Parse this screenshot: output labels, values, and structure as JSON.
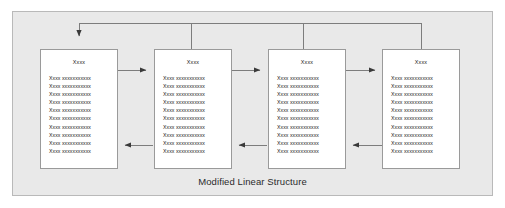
{
  "diagram": {
    "caption": "Modified Linear Structure",
    "panel": {
      "background_color": "#e9e9e9",
      "border_color": "#b9b9b9"
    },
    "line_color": "#7d7d7d",
    "node_border_color": "#9a9a9a",
    "node_fill_color": "#ffffff",
    "text_color": "#1a1a1a",
    "nodes": [
      {
        "id": "node-1",
        "title": "Xxxx",
        "lines": [
          "Xxxx xxxxxxxxxxx",
          "Xxxx xxxxxxxxxxx",
          "Xxxx xxxxxxxxxxx",
          "Xxxx xxxxxxxxxxx",
          "Xxxx xxxxxxxxxxx",
          "Xxxx xxxxxxxxxxx",
          "Xxxx xxxxxxxxxxx",
          "Xxxx xxxxxxxxxxx",
          "Xxxx xxxxxxxxxxx",
          "Xxxx xxxxxxxxxxx"
        ]
      },
      {
        "id": "node-2",
        "title": "Xxxx",
        "lines": [
          "Xxxx xxxxxxxxxxx",
          "Xxxx xxxxxxxxxxx",
          "Xxxx xxxxxxxxxxx",
          "Xxxx xxxxxxxxxxx",
          "Xxxx xxxxxxxxxxx",
          "Xxxx xxxxxxxxxxx",
          "Xxxx xxxxxxxxxxx",
          "Xxxx xxxxxxxxxxx",
          "Xxxx xxxxxxxxxxx",
          "Xxxx xxxxxxxxxxx"
        ]
      },
      {
        "id": "node-3",
        "title": "Xxxx",
        "lines": [
          "Xxxx xxxxxxxxxxx",
          "Xxxx xxxxxxxxxxx",
          "Xxxx xxxxxxxxxxx",
          "Xxxx xxxxxxxxxxx",
          "Xxxx xxxxxxxxxxx",
          "Xxxx xxxxxxxxxxx",
          "Xxxx xxxxxxxxxxx",
          "Xxxx xxxxxxxxxxx",
          "Xxxx xxxxxxxxxxx",
          "Xxxx xxxxxxxxxxx"
        ]
      },
      {
        "id": "node-4",
        "title": "Xxxx",
        "lines": [
          "Xxxx xxxxxxxxxxx",
          "Xxxx xxxxxxxxxxx",
          "Xxxx xxxxxxxxxxx",
          "Xxxx xxxxxxxxxxx",
          "Xxxx xxxxxxxxxxx",
          "Xxxx xxxxxxxxxxx",
          "Xxxx xxxxxxxxxxx",
          "Xxxx xxxxxxxxxxx",
          "Xxxx xxxxxxxxxxx",
          "Xxxx xxxxxxxxxxx"
        ]
      }
    ],
    "connectors": {
      "forward_arrows": [
        "node-1-to-node-2",
        "node-2-to-node-3",
        "node-3-to-node-4"
      ],
      "return_arrows": [
        "node-2-to-node-1",
        "node-3-to-node-2",
        "node-4-to-node-3"
      ],
      "feedback_bus": "nodes-2-3-4-to-node-1"
    }
  }
}
